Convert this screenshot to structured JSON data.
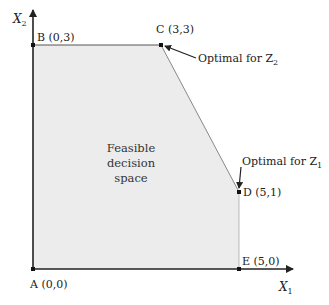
{
  "diagram": {
    "axes": {
      "x_label": "X",
      "x_sub": "1",
      "y_label": "X",
      "y_sub": "2"
    },
    "points": {
      "A": "A (0,0)",
      "B": "B (0,3)",
      "C": "C (3,3)",
      "D": "D (5,1)",
      "E": "E (5,0)"
    },
    "annotations": {
      "z2_text": "Optimal for Z",
      "z2_sub": "2",
      "z1_text": "Optimal for Z",
      "z1_sub": "1"
    },
    "region": {
      "line1": "Feasible",
      "line2": "decision",
      "line3": "space"
    },
    "colors": {
      "region_fill": "#ececec",
      "axis": "#222222",
      "edge": "#888888"
    }
  }
}
